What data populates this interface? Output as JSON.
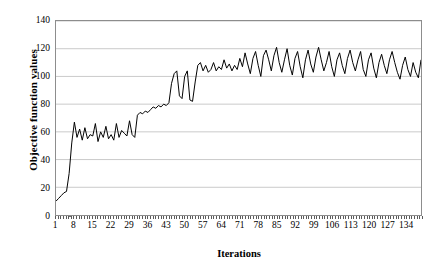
{
  "chart_data": {
    "type": "line",
    "title": "",
    "xlabel": "Iterations",
    "ylabel": "Objective function values",
    "xlim": [
      1,
      140
    ],
    "ylim": [
      0,
      140
    ],
    "ytick_values": [
      0,
      20,
      40,
      60,
      80,
      100,
      120,
      140
    ],
    "xtick_values": [
      1,
      8,
      15,
      22,
      29,
      36,
      43,
      50,
      57,
      64,
      71,
      78,
      85,
      92,
      99,
      106,
      113,
      120,
      127,
      134
    ],
    "grid": "horizontal",
    "legend": "none",
    "line_color": "#000000",
    "series": [
      {
        "name": "Objective function value",
        "x": [
          1,
          2,
          3,
          4,
          5,
          6,
          7,
          8,
          9,
          10,
          11,
          12,
          13,
          14,
          15,
          16,
          17,
          18,
          19,
          20,
          21,
          22,
          23,
          24,
          25,
          26,
          27,
          28,
          29,
          30,
          31,
          32,
          33,
          34,
          35,
          36,
          37,
          38,
          39,
          40,
          41,
          42,
          43,
          44,
          45,
          46,
          47,
          48,
          49,
          50,
          51,
          52,
          53,
          54,
          55,
          56,
          57,
          58,
          59,
          60,
          61,
          62,
          63,
          64,
          65,
          66,
          67,
          68,
          69,
          70,
          71,
          72,
          73,
          74,
          75,
          76,
          77,
          78,
          79,
          80,
          81,
          82,
          83,
          84,
          85,
          86,
          87,
          88,
          89,
          90,
          91,
          92,
          93,
          94,
          95,
          96,
          97,
          98,
          99,
          100,
          101,
          102,
          103,
          104,
          105,
          106,
          107,
          108,
          109,
          110,
          111,
          112,
          113,
          114,
          115,
          116,
          117,
          118,
          119,
          120,
          121,
          122,
          123,
          124,
          125,
          126,
          127,
          128,
          129,
          130,
          131,
          132,
          133,
          134,
          135,
          136,
          137,
          138,
          139,
          140
        ],
        "values": [
          10,
          12,
          14,
          16,
          17,
          30,
          52,
          67,
          56,
          62,
          54,
          63,
          55,
          58,
          57,
          66,
          53,
          60,
          56,
          64,
          55,
          58,
          54,
          66,
          56,
          61,
          59,
          57,
          68,
          58,
          56,
          72,
          74,
          73,
          75,
          74,
          76,
          78,
          77,
          79,
          78,
          80,
          79,
          81,
          95,
          102,
          104,
          86,
          84,
          100,
          104,
          83,
          82,
          96,
          108,
          110,
          104,
          108,
          103,
          105,
          110,
          104,
          107,
          105,
          112,
          106,
          109,
          104,
          108,
          105,
          113,
          107,
          117,
          109,
          102,
          113,
          118,
          108,
          100,
          115,
          119,
          112,
          104,
          115,
          121,
          110,
          103,
          112,
          120,
          108,
          101,
          113,
          118,
          107,
          99,
          112,
          119,
          109,
          103,
          114,
          121,
          112,
          104,
          110,
          118,
          107,
          100,
          112,
          117,
          108,
          102,
          113,
          119,
          110,
          104,
          112,
          118,
          105,
          100,
          112,
          117,
          106,
          99,
          110,
          116,
          108,
          102,
          112,
          118,
          110,
          103,
          98,
          108,
          114,
          105,
          100,
          110,
          103,
          99,
          112
        ]
      }
    ]
  },
  "axes": {
    "ytick_labels": [
      "0",
      "20",
      "40",
      "60",
      "80",
      "100",
      "120",
      "140"
    ],
    "xtick_labels": [
      "1",
      "8",
      "15",
      "22",
      "29",
      "36",
      "43",
      "50",
      "57",
      "64",
      "71",
      "78",
      "85",
      "92",
      "99",
      "106",
      "113",
      "120",
      "127",
      "134"
    ]
  }
}
